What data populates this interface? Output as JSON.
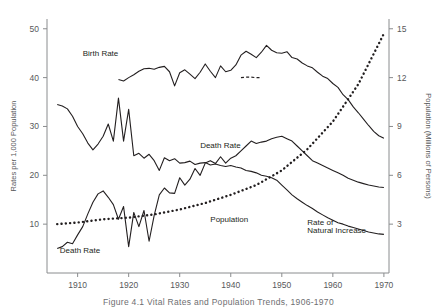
{
  "figure": {
    "caption": "Figure 4.1  Vital Rates and Population Trends, 1906-1970",
    "background": "#ffffff",
    "line_color": "#231f20",
    "axis_color": "#8a8c8e"
  },
  "chart_data": {
    "type": "line",
    "title": "",
    "xlabel": "",
    "ylabel": "Rates per 1,000 Population",
    "y2label": "Population (Millions of Persons)",
    "xlim": [
      1904,
      1971
    ],
    "ylim": [
      0,
      52
    ],
    "y2lim": [
      0,
      15.6
    ],
    "grid": false,
    "legend": "inline-annotations",
    "xticks": [
      1910,
      1920,
      1930,
      1940,
      1950,
      1960,
      1970
    ],
    "yticks": [
      10,
      20,
      30,
      40,
      50
    ],
    "y2ticks": [
      3,
      6,
      9,
      12,
      15
    ],
    "annotations": [
      {
        "text": "Birth Rate",
        "x": 1911,
        "y": 44.5
      },
      {
        "text": "Death Rate",
        "x": 1906.5,
        "y": 4.0
      },
      {
        "text": "Death Rate",
        "x": 1934,
        "y": 25.5
      },
      {
        "text": "Population",
        "x": 1936,
        "y": 10.5
      },
      {
        "text": "Rate of",
        "x": 1955,
        "y": 9.8
      },
      {
        "text": "Natural Increase",
        "x": 1955,
        "y": 8.2
      }
    ],
    "series": [
      {
        "name": "Birth Rate",
        "style": "solid",
        "axis": "left",
        "x": [
          1918,
          1919,
          1920,
          1921,
          1922,
          1923,
          1924,
          1925,
          1926,
          1927,
          1928,
          1929,
          1930,
          1931,
          1932,
          1933,
          1934,
          1935,
          1936,
          1937,
          1938,
          1939,
          1940,
          1941,
          1942,
          1943,
          1944,
          1945,
          1946,
          1947,
          1948,
          1949,
          1950,
          1951,
          1952,
          1953,
          1954,
          1955,
          1956,
          1957,
          1958,
          1959,
          1960,
          1961,
          1962,
          1963,
          1964,
          1965,
          1966,
          1967,
          1968,
          1969,
          1970
        ],
        "values": [
          39.6,
          39.3,
          40.0,
          40.6,
          41.3,
          41.8,
          41.9,
          41.7,
          42.1,
          42.3,
          41.2,
          38.3,
          41.0,
          41.6,
          40.7,
          39.8,
          41.1,
          42.8,
          41.3,
          40.0,
          42.4,
          41.2,
          41.5,
          42.6,
          44.6,
          45.4,
          44.8,
          44.1,
          45.2,
          46.6,
          45.6,
          45.1,
          45.0,
          45.3,
          44.1,
          43.8,
          43.0,
          42.4,
          42.0,
          41.1,
          40.3,
          39.8,
          38.8,
          38.0,
          36.5,
          35.5,
          34.0,
          32.8,
          31.5,
          30.2,
          29.0,
          28.1,
          27.6
        ]
      },
      {
        "name": "Birth Rate (interpolated)",
        "style": "dotted-dash",
        "axis": "left",
        "x": [
          1942,
          1943,
          1944,
          1945,
          1946
        ],
        "values": [
          40.0,
          40.1,
          40.1,
          40.0,
          40.0
        ]
      },
      {
        "name": "Death Rate",
        "style": "solid",
        "axis": "left",
        "x": [
          1906,
          1907,
          1908,
          1909,
          1910,
          1911,
          1912,
          1913,
          1914,
          1915,
          1916,
          1917,
          1918,
          1919,
          1920,
          1921,
          1922,
          1923,
          1924,
          1925,
          1926,
          1927,
          1928,
          1929,
          1930,
          1931,
          1932,
          1933,
          1934,
          1935,
          1936,
          1937,
          1938,
          1939,
          1940,
          1941,
          1942,
          1943,
          1944,
          1945,
          1946,
          1947,
          1948,
          1949,
          1950,
          1951,
          1952,
          1953,
          1954,
          1955,
          1956,
          1957,
          1958,
          1959,
          1960,
          1961,
          1962,
          1963,
          1964,
          1965,
          1966,
          1967,
          1968,
          1969,
          1970
        ],
        "values": [
          34.5,
          34.2,
          33.6,
          32.1,
          30.0,
          28.5,
          26.6,
          25.2,
          26.4,
          28.0,
          30.5,
          27.0,
          35.8,
          27.0,
          33.5,
          24.0,
          24.5,
          23.5,
          24.3,
          23.0,
          21.0,
          23.6,
          23.0,
          23.4,
          22.5,
          22.6,
          22.9,
          22.2,
          22.5,
          22.6,
          22.1,
          22.3,
          22.0,
          21.8,
          22.0,
          21.7,
          21.5,
          21.0,
          20.8,
          20.5,
          20.0,
          19.8,
          19.5,
          19.0,
          18.0,
          17.0,
          16.0,
          15.2,
          14.5,
          13.8,
          13.2,
          12.5,
          11.9,
          11.3,
          10.8,
          10.3,
          10.0,
          9.6,
          9.3,
          9.0,
          8.7,
          8.4,
          8.2,
          8.0,
          7.9
        ]
      },
      {
        "name": "Rate of Natural Increase",
        "style": "solid",
        "axis": "left",
        "x": [
          1906,
          1907,
          1908,
          1909,
          1910,
          1911,
          1912,
          1913,
          1914,
          1915,
          1916,
          1917,
          1918,
          1919,
          1920,
          1921,
          1922,
          1923,
          1924,
          1925,
          1926,
          1927,
          1928,
          1929,
          1930,
          1931,
          1932,
          1933,
          1934,
          1935,
          1936,
          1937,
          1938,
          1939,
          1940,
          1941,
          1942,
          1943,
          1944,
          1945,
          1946,
          1947,
          1948,
          1949,
          1950,
          1951,
          1952,
          1953,
          1954,
          1955,
          1956,
          1957,
          1958,
          1959,
          1960,
          1961,
          1962,
          1963,
          1964,
          1965,
          1966,
          1967,
          1968,
          1969,
          1970
        ],
        "values": [
          5.0,
          5.4,
          6.3,
          6.0,
          7.8,
          9.5,
          12.1,
          14.5,
          16.2,
          16.8,
          15.5,
          14.0,
          11.0,
          13.6,
          5.4,
          12.4,
          9.5,
          12.8,
          6.5,
          11.8,
          16.0,
          17.4,
          16.4,
          16.3,
          19.5,
          18.0,
          19.2,
          21.4,
          20.0,
          22.5,
          23.0,
          22.4,
          23.8,
          22.5,
          23.5,
          24.0,
          25.0,
          26.0,
          27.0,
          26.5,
          26.8,
          27.0,
          27.5,
          27.8,
          28.0,
          27.5,
          27.0,
          26.0,
          25.0,
          24.0,
          23.0,
          22.5,
          22.0,
          21.5,
          21.0,
          20.5,
          20.0,
          19.4,
          19.0,
          18.6,
          18.3,
          18.0,
          17.8,
          17.6,
          17.5
        ]
      },
      {
        "name": "Population",
        "style": "dotted",
        "axis": "right",
        "x": [
          1906,
          1910,
          1915,
          1920,
          1925,
          1930,
          1935,
          1940,
          1945,
          1950,
          1955,
          1960,
          1965,
          1970
        ],
        "values": [
          3.0,
          3.1,
          3.3,
          3.4,
          3.6,
          3.9,
          4.3,
          4.8,
          5.4,
          6.3,
          7.6,
          9.3,
          11.6,
          14.7
        ]
      }
    ]
  }
}
